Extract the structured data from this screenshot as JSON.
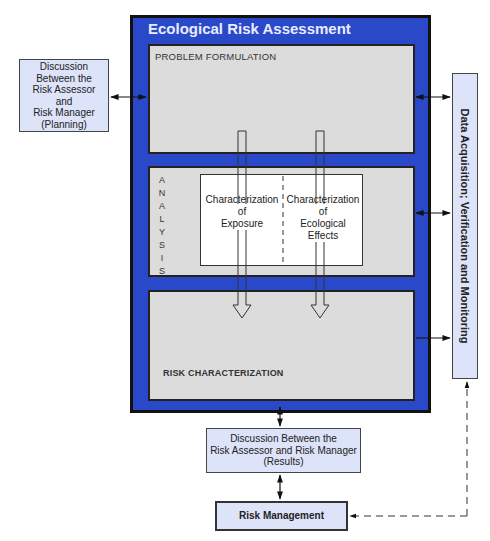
{
  "outer": {
    "title": "Ecological Risk Assessment",
    "fill_color": "#2a49c8"
  },
  "panels": {
    "problem_formulation": "PROBLEM FORMULATION",
    "analysis_letters": [
      "A",
      "N",
      "A",
      "L",
      "Y",
      "S",
      "I",
      "S"
    ],
    "analysis_label": "ANALYSIS",
    "risk_characterization": "RISK CHARACTERIZATION"
  },
  "analysis_inner": {
    "exposure": [
      "Characterization",
      "of",
      "Exposure"
    ],
    "effects": [
      "Characterization",
      "of",
      "Ecological",
      "Effects"
    ]
  },
  "planning_box": {
    "lines": [
      "Discussion",
      "Between the",
      "Risk Assessor",
      "and",
      "Risk Manager",
      "(Planning)"
    ]
  },
  "data_box": {
    "text": "Data Acquisition; Verification and Monitoring"
  },
  "results_box": {
    "lines": [
      "Discussion Between the",
      "Risk Assessor and Risk Manager",
      "(Results)"
    ]
  },
  "management_box": {
    "text": "Risk Management"
  },
  "colors": {
    "side_box_fill": "#dde3f8",
    "panel_fill": "#dcdcdc",
    "border": "#111111"
  }
}
